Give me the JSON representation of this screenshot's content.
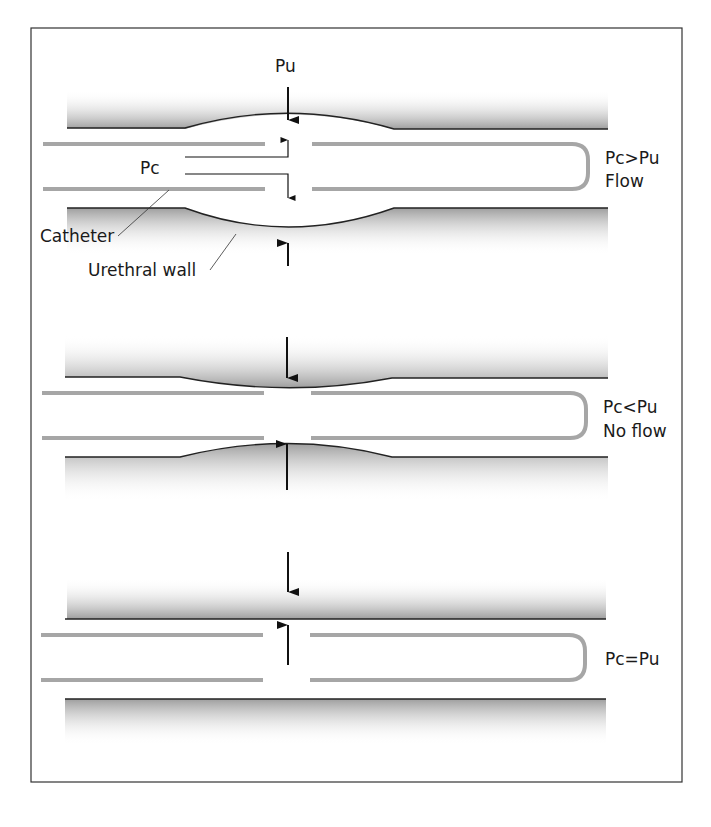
{
  "figure": {
    "border_color": "#333333",
    "wall_shade": "#a8a8a8",
    "catheter_color": "#a6a6a6",
    "line_color": "#222222"
  },
  "panels": [
    {
      "id": "pc-greater",
      "pressure_label": "Pu",
      "catheter_pressure_label": "Pc",
      "condition": "Pc>Pu",
      "outcome": "Flow",
      "callouts": {
        "catheter": "Catheter",
        "urethral_wall": "Urethral wall"
      }
    },
    {
      "id": "pc-less",
      "condition": "Pc<Pu",
      "outcome": "No flow"
    },
    {
      "id": "pc-equal",
      "condition": "Pc=Pu"
    }
  ]
}
